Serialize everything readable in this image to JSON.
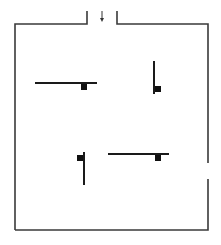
{
  "diagram": {
    "type": "floor-plan",
    "stroke_color": "#1a1a1a",
    "wall_color": "#3a3a3a",
    "entrance": {
      "left_post": {
        "x": 87,
        "y1": 11,
        "y2": 24
      },
      "right_post": {
        "x": 117,
        "y1": 11,
        "y2": 24
      },
      "arrow": {
        "x": 102,
        "y1": 11,
        "y2": 21,
        "direction": "down"
      }
    },
    "room": {
      "left": 15,
      "top": 24,
      "right": 208,
      "bottom": 230,
      "right_wall_gap": {
        "y1": 163,
        "y2": 179
      }
    },
    "obstacles": [
      {
        "id": "top-left",
        "orientation": "horizontal",
        "x1": 35,
        "y1": 83,
        "x2": 97,
        "y2": 83,
        "square": {
          "x": 81,
          "y": 84,
          "size": 6
        }
      },
      {
        "id": "top-right",
        "orientation": "vertical",
        "x1": 154,
        "y1": 61,
        "x2": 154,
        "y2": 94,
        "square": {
          "x": 155,
          "y": 86,
          "size": 6
        }
      },
      {
        "id": "bottom-left",
        "orientation": "vertical",
        "x1": 84,
        "y1": 152,
        "x2": 84,
        "y2": 185,
        "square": {
          "x": 77,
          "y": 155,
          "size": 6
        }
      },
      {
        "id": "bottom-right",
        "orientation": "horizontal",
        "x1": 108,
        "y1": 154,
        "x2": 169,
        "y2": 154,
        "square": {
          "x": 155,
          "y": 155,
          "size": 6
        }
      }
    ]
  }
}
